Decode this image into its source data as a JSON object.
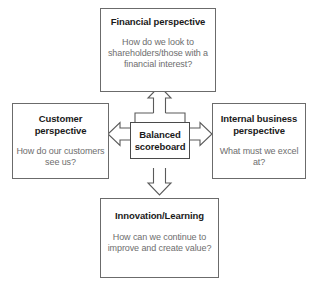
{
  "diagram": {
    "title": "Balanced scoreboard",
    "colors": {
      "background": "#ffffff",
      "box_border": "#6b6b6b",
      "arrow_stroke": "#5a5a5a",
      "arrow_fill": "#ffffff",
      "title_text": "#1a1a1a",
      "body_text": "#6e6e6e"
    },
    "center": {
      "label": "Balanced scoreboard"
    },
    "nodes": [
      {
        "id": "financial",
        "title": "Financial perspective",
        "body": "How do we look to shareholders/those with a financial interest?",
        "position": "top"
      },
      {
        "id": "customer",
        "title": "Customer perspective",
        "body": "How do our customers see us?",
        "position": "left"
      },
      {
        "id": "internal",
        "title": "Internal business perspective",
        "body": "What must we excel at?",
        "position": "right"
      },
      {
        "id": "innovation",
        "title": "Innovation/Learning",
        "body": "How can we continue to improve and create value?",
        "position": "bottom"
      }
    ],
    "connectors": [
      {
        "id": "arrow-up",
        "icon": "arrow-up-icon",
        "from": "center",
        "to": "financial"
      },
      {
        "id": "arrow-left",
        "icon": "arrow-left-icon",
        "from": "center",
        "to": "customer"
      },
      {
        "id": "arrow-right",
        "icon": "arrow-right-icon",
        "from": "center",
        "to": "internal"
      },
      {
        "id": "arrow-down",
        "icon": "arrow-down-icon",
        "from": "center",
        "to": "innovation"
      }
    ]
  }
}
